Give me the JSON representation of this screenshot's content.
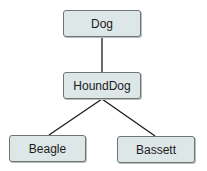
{
  "diagram": {
    "type": "class-hierarchy-tree",
    "nodes": [
      {
        "id": "dog",
        "label": "Dog"
      },
      {
        "id": "hounddog",
        "label": "HoundDog"
      },
      {
        "id": "beagle",
        "label": "Beagle"
      },
      {
        "id": "bassett",
        "label": "Bassett"
      }
    ],
    "edges": [
      {
        "from": "dog",
        "to": "hounddog"
      },
      {
        "from": "hounddog",
        "to": "beagle"
      },
      {
        "from": "hounddog",
        "to": "bassett"
      }
    ],
    "colors": {
      "node_fill": "#dde7e7",
      "node_border": "#6f7474",
      "edge": "#1b1b1b"
    }
  }
}
